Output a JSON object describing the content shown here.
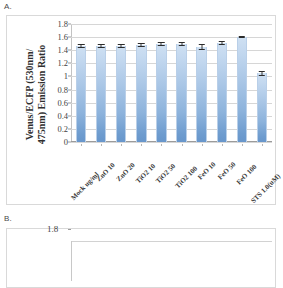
{
  "figure": {
    "panel_a_label": "A.",
    "panel_b_label": "B."
  },
  "chart_data": {
    "type": "bar",
    "title": "",
    "xlabel": "",
    "ylabel": "Venus/ECFP (530nm/475nm) Emission Ratio",
    "ylabel_line1": "Venus/ECFP (530nm/",
    "ylabel_line2": "475nm) Emission Ratio",
    "ylim": [
      0,
      1.8
    ],
    "ytick_labels": [
      "1.8",
      "1.6",
      "1.4",
      "1.2",
      "1",
      "0.8",
      "0.6",
      "0.4",
      "0.2",
      "0"
    ],
    "ytick_values": [
      1.8,
      1.6,
      1.4,
      1.2,
      1.0,
      0.8,
      0.6,
      0.4,
      0.2,
      0
    ],
    "grid": true,
    "legend": "none",
    "bar_color": "#8db3dc",
    "categories": [
      "Mock  ug/ml",
      "ZnO  10",
      "ZnO  20",
      "TiO2  10",
      "TiO2  50",
      "TiO2  100",
      "FeO  10",
      "FeO  50",
      "FeO  100",
      "STS 1.0(uM)"
    ],
    "values": [
      1.47,
      1.46,
      1.47,
      1.48,
      1.49,
      1.5,
      1.45,
      1.51,
      1.6,
      1.05
    ],
    "errors": [
      0.03,
      0.03,
      0.03,
      0.03,
      0.03,
      0.03,
      0.05,
      0.03,
      0.02,
      0.04
    ]
  },
  "chart_b": {
    "ytop_label": "1.8"
  }
}
